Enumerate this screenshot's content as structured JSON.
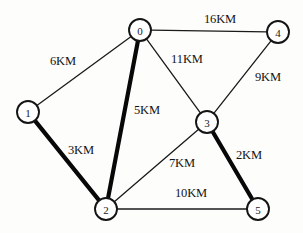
{
  "figure": {
    "background_color": "#fdfdfc",
    "line_color": "#141414",
    "node_fill": "#ffffff",
    "width": 303,
    "height": 233
  },
  "nodes": [
    {
      "id": "0",
      "label": "0",
      "x": 140,
      "y": 30,
      "r": 11
    },
    {
      "id": "1",
      "label": "1",
      "x": 28,
      "y": 112,
      "r": 11
    },
    {
      "id": "2",
      "label": "2",
      "x": 106,
      "y": 209,
      "r": 11
    },
    {
      "id": "3",
      "label": "3",
      "x": 207,
      "y": 122,
      "r": 11
    },
    {
      "id": "4",
      "label": "4",
      "x": 278,
      "y": 32,
      "r": 11
    },
    {
      "id": "5",
      "label": "5",
      "x": 258,
      "y": 209,
      "r": 11
    }
  ],
  "edges": [
    {
      "from": "0",
      "to": "4",
      "weight": "16KM",
      "bold": false,
      "label_x": 220,
      "label_y": 19
    },
    {
      "from": "0",
      "to": "1",
      "weight": "6KM",
      "bold": false,
      "label_x": 63,
      "label_y": 61
    },
    {
      "from": "0",
      "to": "3",
      "weight": "11KM",
      "bold": false,
      "label_x": 187,
      "label_y": 59
    },
    {
      "from": "0",
      "to": "2",
      "weight": "5KM",
      "bold": true,
      "label_x": 147,
      "label_y": 110
    },
    {
      "from": "4",
      "to": "3",
      "weight": "9KM",
      "bold": false,
      "label_x": 268,
      "label_y": 77
    },
    {
      "from": "1",
      "to": "2",
      "weight": "3KM",
      "bold": true,
      "label_x": 81,
      "label_y": 150
    },
    {
      "from": "2",
      "to": "3",
      "weight": "7KM",
      "bold": false,
      "label_x": 182,
      "label_y": 163
    },
    {
      "from": "3",
      "to": "5",
      "weight": "2KM",
      "bold": true,
      "label_x": 249,
      "label_y": 155
    },
    {
      "from": "2",
      "to": "5",
      "weight": "10KM",
      "bold": false,
      "label_x": 191,
      "label_y": 193
    }
  ],
  "chart_data": {
    "type": "diagram",
    "diagram_type": "weighted-undirected-graph",
    "unit": "KM",
    "node_ids": [
      "0",
      "1",
      "2",
      "3",
      "4",
      "5"
    ],
    "edge_list": [
      {
        "u": "0",
        "v": "4",
        "w": 16,
        "highlighted": false
      },
      {
        "u": "0",
        "v": "1",
        "w": 6,
        "highlighted": false
      },
      {
        "u": "0",
        "v": "3",
        "w": 11,
        "highlighted": false
      },
      {
        "u": "0",
        "v": "2",
        "w": 5,
        "highlighted": true
      },
      {
        "u": "4",
        "v": "3",
        "w": 9,
        "highlighted": false
      },
      {
        "u": "1",
        "v": "2",
        "w": 3,
        "highlighted": true
      },
      {
        "u": "2",
        "v": "3",
        "w": 7,
        "highlighted": false
      },
      {
        "u": "3",
        "v": "5",
        "w": 2,
        "highlighted": true
      },
      {
        "u": "2",
        "v": "5",
        "w": 10,
        "highlighted": false
      }
    ],
    "highlighted_edges": [
      "1-2",
      "0-2",
      "3-5"
    ],
    "title": "",
    "legend": []
  }
}
